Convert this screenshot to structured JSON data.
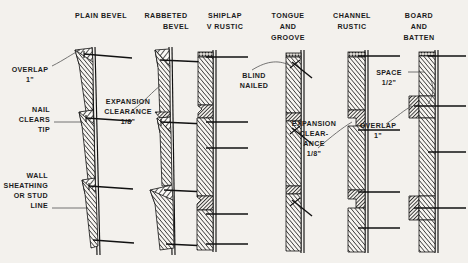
{
  "figure": {
    "background_color": "#f3f1ed",
    "ink_color": "#1b1b1b",
    "leader_color": "#4a4a4a",
    "columns": 6,
    "style": "scanned black-and-white technical line drawing, cross-section views"
  },
  "headers": [
    {
      "id": "plain-bevel",
      "lines": [
        "PLAIN BEVEL"
      ],
      "align": "center"
    },
    {
      "id": "rabbeted-bevel",
      "lines": [
        "RABBETED",
        "BEVEL"
      ],
      "align": "center"
    },
    {
      "id": "shiplap",
      "lines": [
        "SHIPLAP",
        "V RUSTIC"
      ],
      "align": "center"
    },
    {
      "id": "tongue-groove",
      "lines": [
        "TONGUE",
        "AND",
        "GROOVE"
      ],
      "align": "center"
    },
    {
      "id": "channel-rustic",
      "lines": [
        "CHANNEL",
        "RUSTIC"
      ],
      "align": "center"
    },
    {
      "id": "board-batten",
      "lines": [
        "BOARD",
        "AND",
        "BATTEN"
      ],
      "align": "center"
    }
  ],
  "callouts": [
    {
      "id": "overlap-left",
      "lines": [
        "OVERLAP",
        "1\""
      ],
      "align": "center",
      "leader": "curve"
    },
    {
      "id": "nail-clears-tip",
      "lines": [
        "NAIL",
        "CLEARS",
        "TIP"
      ],
      "align": "right",
      "leader": "straight"
    },
    {
      "id": "wall-sheathing",
      "lines": [
        "WALL",
        "SHEATHING",
        "OR STUD",
        "LINE"
      ],
      "align": "right",
      "leader": "straight"
    },
    {
      "id": "expansion-clearance-bevel",
      "lines": [
        "EXPANSION",
        "CLEARANCE",
        "1/8\""
      ],
      "align": "center",
      "leader": "curve"
    },
    {
      "id": "blind-nailed",
      "lines": [
        "BLIND",
        "NAILED"
      ],
      "align": "center",
      "leader": "curve"
    },
    {
      "id": "expansion-clearance-channel",
      "lines": [
        "EXPANSION",
        "CLEAR-",
        "ANCE",
        "1/8\""
      ],
      "align": "center",
      "leader": "curve"
    },
    {
      "id": "space-half-inch",
      "lines": [
        "SPACE",
        "1/2\""
      ],
      "align": "center",
      "leader": "straight"
    },
    {
      "id": "overlap-right",
      "lines": [
        "OVERLAP",
        "1\""
      ],
      "align": "center",
      "leader": "curve"
    }
  ],
  "measurements": {
    "overlap": "1\"",
    "expansion_clearance": "1/8\"",
    "batten_space": "1/2\""
  }
}
